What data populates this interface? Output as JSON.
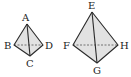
{
  "diagram": {
    "type": "two tetrahedra (triangular pyramids)",
    "small_tetrahedron": {
      "vertices": {
        "A": "A",
        "B": "B",
        "C": "C",
        "D": "D"
      },
      "hidden_edge": "BD"
    },
    "large_tetrahedron": {
      "vertices": {
        "E": "E",
        "F": "F",
        "G": "G",
        "H": "H"
      },
      "hidden_edge": "FH"
    },
    "colors": {
      "face": "#e2e2e2",
      "edge": "#2a2a2a"
    }
  }
}
